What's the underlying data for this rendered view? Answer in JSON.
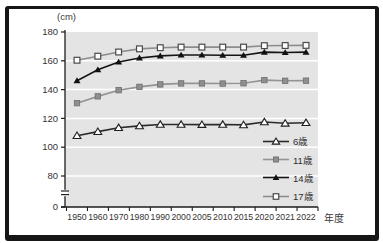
{
  "chart_data": {
    "type": "line",
    "title": "",
    "ylabel": "(cm)",
    "xlabel": "年度",
    "categories": [
      "1950",
      "1960",
      "1970",
      "1980",
      "1990",
      "2000",
      "2005",
      "2010",
      "2015",
      "2020",
      "2021",
      "2022"
    ],
    "y_ticks": [
      0,
      80,
      100,
      120,
      140,
      160,
      180
    ],
    "ylim": [
      80,
      180
    ],
    "axis_break_between": [
      0,
      80
    ],
    "grid": true,
    "plot_bg": "#e4e4e4",
    "grid_color": "#ffffff",
    "axis_color": "#1c1c1c",
    "legend_position": "inside-bottom-right",
    "series": [
      {
        "name": "6歳",
        "marker": "triangle-open",
        "color": "#2b2b2b",
        "values": [
          108.0,
          110.8,
          113.5,
          114.8,
          115.8,
          115.8,
          115.7,
          115.8,
          115.5,
          117.5,
          116.6,
          117.0
        ]
      },
      {
        "name": "11歳",
        "marker": "square-filled",
        "color": "#949494",
        "values": [
          130.6,
          135.3,
          139.6,
          141.9,
          143.6,
          144.3,
          144.3,
          144.2,
          144.4,
          146.6,
          146.1,
          146.2
        ]
      },
      {
        "name": "14歳",
        "marker": "triangle-filled",
        "color": "#141414",
        "values": [
          146.2,
          153.8,
          159.2,
          162.0,
          163.4,
          164.0,
          164.0,
          163.9,
          163.9,
          166.0,
          165.8,
          166.0
        ]
      },
      {
        "name": "17歳",
        "marker": "square-open",
        "color": "#8c8c8c",
        "values": [
          160.4,
          163.2,
          166.1,
          168.3,
          169.1,
          169.5,
          169.5,
          169.5,
          169.5,
          170.5,
          170.6,
          170.7
        ]
      }
    ]
  }
}
